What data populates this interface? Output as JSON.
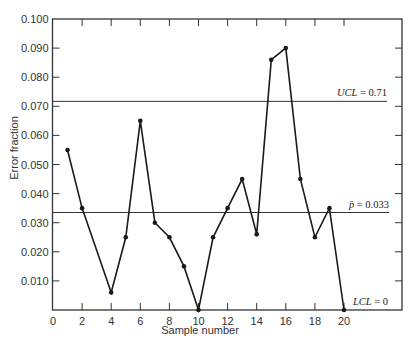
{
  "chart_data": {
    "type": "line",
    "title": "",
    "xlabel": "Sample number",
    "ylabel": "Error fraction",
    "xlim": [
      0,
      24
    ],
    "ylim": [
      0,
      0.1
    ],
    "x_ticks": [
      0,
      2,
      4,
      6,
      8,
      10,
      12,
      14,
      16,
      18,
      20
    ],
    "y_ticks": [
      0.01,
      0.02,
      0.03,
      0.04,
      0.05,
      0.06,
      0.07,
      0.08,
      0.09,
      0.1
    ],
    "y_tick_labels": [
      "0.010",
      "0.020",
      "0.030",
      "0.040",
      "0.050",
      "0.060",
      "0.070",
      "0.080",
      "0.090",
      "0.100"
    ],
    "grid": false,
    "legend": null,
    "series": [
      {
        "name": "Error fraction",
        "x": [
          1,
          2,
          4,
          5,
          6,
          7,
          8,
          9,
          10,
          11,
          12,
          13,
          14,
          15,
          16,
          17,
          18,
          19,
          20
        ],
        "values": [
          0.055,
          0.035,
          0.006,
          0.025,
          0.065,
          0.03,
          0.025,
          0.015,
          0.0,
          0.025,
          0.035,
          0.045,
          0.026,
          0.086,
          0.09,
          0.045,
          0.025,
          0.035,
          0.0
        ]
      }
    ],
    "reference_lines": [
      {
        "name": "UCL",
        "value": 0.0717,
        "label_italic": "UCL",
        "label_value": " = 0.71"
      },
      {
        "name": "mean",
        "value": 0.0335,
        "label_italic": "p̄",
        "label_value": " = 0.033"
      },
      {
        "name": "LCL",
        "value": 0.0,
        "label_italic": "LCL",
        "label_value": " = 0"
      }
    ]
  },
  "colors": {
    "line": "#1a1a1a",
    "axis": "#333333",
    "background": "#ffffff"
  }
}
